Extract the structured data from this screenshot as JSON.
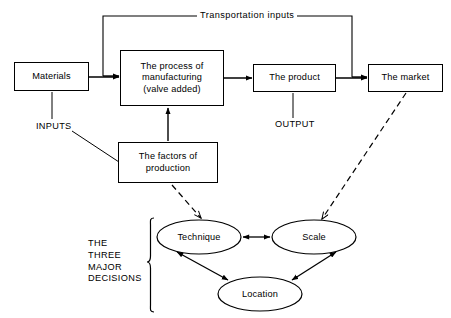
{
  "diagram": {
    "background_color": "#ffffff",
    "line_color": "#000000",
    "boxes": {
      "materials": "Materials",
      "process": "The process of\nmanufacturing\n(valve added)",
      "product": "The product",
      "market": "The market",
      "factors": "The factors of\nproduction"
    },
    "ellipses": {
      "technique": "Technique",
      "scale": "Scale",
      "location": "Location"
    },
    "labels": {
      "transportation": "Transportation inputs",
      "inputs": "INPUTS",
      "output": "OUTPUT",
      "three_major_decisions": "THE\nTHREE\nMAJOR\nDECISIONS"
    }
  }
}
